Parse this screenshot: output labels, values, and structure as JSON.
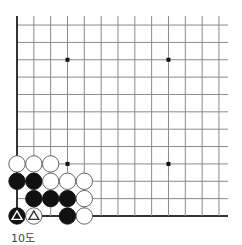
{
  "diagram": {
    "type": "go-board-partial",
    "caption": "10도",
    "grid": {
      "columns": 13,
      "rows": 12,
      "origin_x": 17,
      "bottom_y": 216,
      "top_y": 25,
      "col_spacing": 16.83,
      "row_spacing": 17.36,
      "left_edge_visible": true,
      "bottom_edge_visible": true,
      "line_color": "#8a8a8a",
      "edge_color": "#333333"
    },
    "star_points": [
      {
        "col": 4,
        "row": 10
      },
      {
        "col": 10,
        "row": 10
      },
      {
        "col": 4,
        "row": 4
      },
      {
        "col": 10,
        "row": 4
      }
    ],
    "stones": [
      {
        "color": "white",
        "col": 1,
        "row": 4
      },
      {
        "color": "white",
        "col": 2,
        "row": 4
      },
      {
        "color": "white",
        "col": 3,
        "row": 4
      },
      {
        "color": "black",
        "col": 1,
        "row": 3
      },
      {
        "color": "black",
        "col": 2,
        "row": 3
      },
      {
        "color": "white",
        "col": 3,
        "row": 3
      },
      {
        "color": "white",
        "col": 4,
        "row": 3
      },
      {
        "color": "white",
        "col": 5,
        "row": 3
      },
      {
        "color": "black",
        "col": 2,
        "row": 2
      },
      {
        "color": "black",
        "col": 3,
        "row": 2
      },
      {
        "color": "black",
        "col": 4,
        "row": 2
      },
      {
        "color": "white",
        "col": 5,
        "row": 2
      },
      {
        "color": "black",
        "col": 1,
        "row": 1,
        "mark": "triangle"
      },
      {
        "color": "white",
        "col": 2,
        "row": 1,
        "mark": "triangle"
      },
      {
        "color": "black",
        "col": 4,
        "row": 1
      },
      {
        "color": "white",
        "col": 5,
        "row": 1
      }
    ],
    "colors": {
      "black_stone": "#111111",
      "white_stone": "#ffffff",
      "white_stone_stroke": "#555555",
      "star_point": "#111111"
    }
  }
}
